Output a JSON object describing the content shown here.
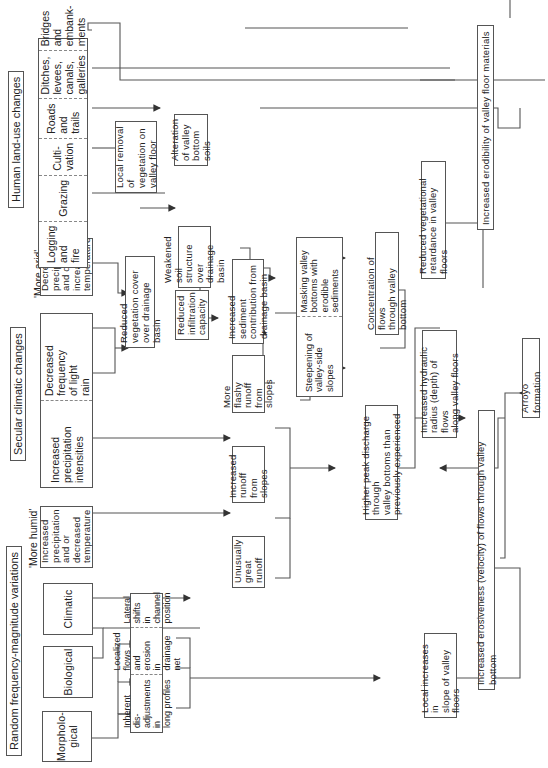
{
  "diagram": {
    "type": "flowchart",
    "orientation": "rotated-90-ccw",
    "groups": {
      "random": {
        "label": "Random frequency-magnitude variations",
        "items": [
          "Morpholo-\ngical",
          "Biological",
          "Climatic"
        ]
      },
      "secular": {
        "label": "Secular climatic changes",
        "more_humid_tag": "'More humid'",
        "more_humid": "Increased\nprecipitation\nand or\ndecreased\ntemperature",
        "rain_items": [
          "Increased\nprecipitation\nintensities",
          "Decreased\nfrequency\nof light\nrain"
        ],
        "more_arid_tag": "'More arid'",
        "more_arid": "Decreased\nprecipitation\nand or\nincreased\ntemperature"
      },
      "human": {
        "label": "Human land-use changes",
        "items": [
          "Logging\nand\nfire",
          "Grazing",
          "Culti-\nvation",
          "Roads\nand\ntrails",
          "Ditches,\nlevees,\ncanals,\ngalleries",
          "Bridges\nand\nembank-\nments"
        ]
      }
    },
    "nodes": {
      "local_removal": "Local removal of\nvegetation on\nvalley floor",
      "alteration_soils": "Alteration\nof valley\nbottom soils",
      "reduced_veg_cover": "Reduced vegetation cover\nover drainage basin",
      "weakened_soil": "Weakened soil\nstructure over\ndrainage basin",
      "reduced_infiltration": "Reduced\ninfiltration\ncapacity",
      "increased_sediment": "Increased sediment\ncontribution from\ndrainage basin",
      "more_flashy": "More flashy\nrunoff\nfrom slopes",
      "increased_runoff": "Increased\nrunoff\nfrom slopes",
      "unusually_great": "Unusually\ngreat\nrunoff",
      "valley_segments": [
        "Steepening of\nvalley-side\nslopes",
        "Masking valley\nbottoms with\nerodible\nsediments"
      ],
      "channel_segments": [
        "Inherent dis-\nadjustments in\nlong profiles",
        "Localized flows\nand erosion in\ndrainage net",
        "Lateral shifts\nin channel\nposition"
      ],
      "concentration": "Concentration of flows\nthrough valley bottom",
      "higher_peak": "Higher peak discharge through\nvalley bottoms than\npreviously experienced",
      "hydraulic_radius": "Increased hydraulic\nradius (depth) of flows\nalong valley floors",
      "local_slope": "Local increases in\nslope of valley\nfloors",
      "veg_retardance": "Reduced vegetational\nretardance in valley floors",
      "erodibility": "Increased erodibility of valley floor materials",
      "erosiveness": "Increased erosiveness (velocity) of flows through valley bottom",
      "arroyo": "Arroyo formation"
    },
    "colors": {
      "line": "#555555",
      "background": "#ffffff",
      "text": "#222222"
    }
  }
}
